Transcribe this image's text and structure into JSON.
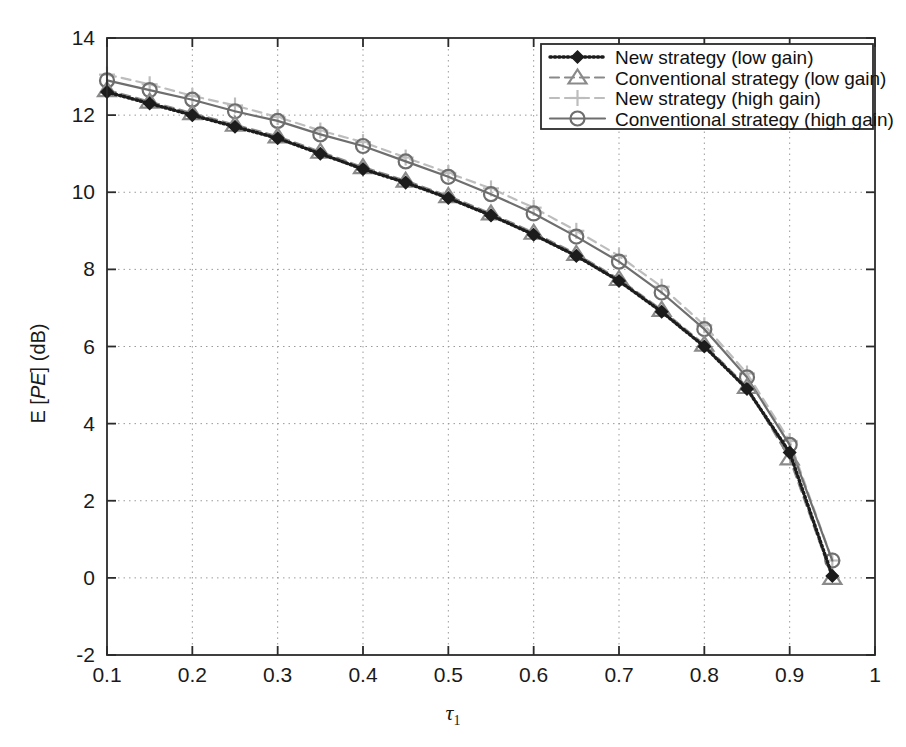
{
  "chart_data": {
    "type": "line",
    "title": "",
    "xlabel": "τ₁",
    "ylabel": "E [PE] (dB)",
    "xlim": [
      0.1,
      1.0
    ],
    "ylim": [
      -2,
      14
    ],
    "xticks": [
      "0.1",
      "0.2",
      "0.3",
      "0.4",
      "0.5",
      "0.6",
      "0.7",
      "0.8",
      "0.9",
      "1"
    ],
    "yticks": [
      "-2",
      "0",
      "2",
      "4",
      "6",
      "8",
      "10",
      "12",
      "14"
    ],
    "grid": true,
    "legend_position": "top-right",
    "x": [
      0.1,
      0.15,
      0.2,
      0.25,
      0.3,
      0.35,
      0.4,
      0.45,
      0.5,
      0.55,
      0.6,
      0.65,
      0.7,
      0.75,
      0.8,
      0.85,
      0.9,
      0.95
    ],
    "series": [
      {
        "name": "New strategy (low gain)",
        "marker": "diamond-filled",
        "linestyle": "dotted",
        "color": "#1c1c1c",
        "values": [
          12.6,
          12.3,
          12.0,
          11.7,
          11.4,
          11.0,
          10.6,
          10.25,
          9.85,
          9.4,
          8.9,
          8.35,
          7.7,
          6.9,
          6.0,
          4.9,
          3.25,
          0.05
        ]
      },
      {
        "name": "Conventional strategy (low gain)",
        "marker": "triangle",
        "linestyle": "dashed",
        "color": "#8a8a8a",
        "values": [
          12.65,
          12.35,
          12.05,
          11.75,
          11.45,
          11.05,
          10.65,
          10.3,
          9.9,
          9.45,
          8.95,
          8.4,
          7.75,
          6.95,
          6.05,
          4.95,
          3.1,
          0.0
        ]
      },
      {
        "name": "New strategy (high gain)",
        "marker": "plus",
        "linestyle": "dashed",
        "color": "#bdbdbd",
        "values": [
          13.05,
          12.8,
          12.5,
          12.25,
          11.95,
          11.6,
          11.3,
          10.9,
          10.5,
          10.1,
          9.6,
          9.0,
          8.35,
          7.55,
          6.55,
          5.3,
          3.55,
          0.45
        ]
      },
      {
        "name": "Conventional strategy (high gain)",
        "marker": "circle",
        "linestyle": "solid",
        "color": "#6e6e6e",
        "values": [
          12.9,
          12.65,
          12.4,
          12.1,
          11.85,
          11.5,
          11.2,
          10.8,
          10.4,
          9.95,
          9.45,
          8.85,
          8.2,
          7.4,
          6.45,
          5.2,
          3.45,
          0.45
        ]
      }
    ]
  }
}
